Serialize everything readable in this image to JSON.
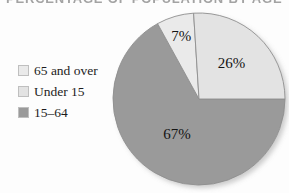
{
  "title": {
    "text": "PERCENTAGE OF POPULATION BY AGE GROUP",
    "cropped": true
  },
  "legend": {
    "position": "left",
    "items": [
      {
        "label": "65 and over",
        "color": "#eaeaea",
        "swatch_name": "legend-swatch-65-and-over"
      },
      {
        "label": "Under 15",
        "color": "#e3e3e3",
        "swatch_name": "legend-swatch-under-15"
      },
      {
        "label": "15–64",
        "color": "#9a9a9a",
        "swatch_name": "legend-swatch-15-64"
      }
    ]
  },
  "labels": {
    "slice_1": "67%",
    "slice_2": "7%",
    "slice_3": "26%"
  },
  "chart_data": {
    "type": "pie",
    "title": "PERCENTAGE OF POPULATION BY AGE GROUP",
    "categories": [
      "15–64",
      "65 and over",
      "Under 15"
    ],
    "values": [
      67,
      7,
      26
    ],
    "value_labels": [
      "67%",
      "7%",
      "26%"
    ],
    "units": "percent",
    "total": 100,
    "colors": [
      "#9a9a9a",
      "#eaeaea",
      "#e3e3e3"
    ],
    "start_angle_deg": 0,
    "direction": "clockwise",
    "legend_position": "left",
    "grid": false,
    "xlabel": "",
    "ylabel": "",
    "series": [
      {
        "name": "Population share",
        "points": [
          {
            "category": "15–64",
            "value": 67,
            "label": "67%",
            "color": "#9a9a9a"
          },
          {
            "category": "65 and over",
            "value": 7,
            "label": "7%",
            "color": "#eaeaea"
          },
          {
            "category": "Under 15",
            "value": 26,
            "label": "26%",
            "color": "#e3e3e3"
          }
        ]
      }
    ]
  }
}
